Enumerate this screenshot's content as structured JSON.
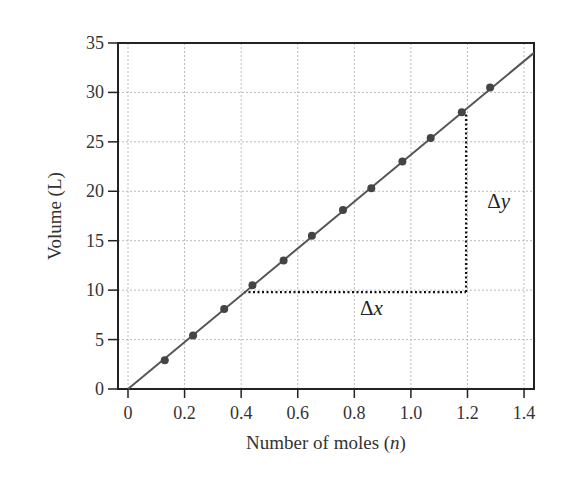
{
  "chart_data": {
    "type": "line",
    "title": "",
    "xlabel": "Number of moles (n)",
    "xlabel_parts": {
      "prefix": "Number of moles (",
      "var": "n",
      "suffix": ")"
    },
    "ylabel": "Volume (L)",
    "xlim": [
      0,
      1.45
    ],
    "ylim": [
      0,
      35
    ],
    "xticks": [
      "0",
      "0.2",
      "0.4",
      "0.6",
      "0.8",
      "1.0",
      "1.2",
      "1.4"
    ],
    "xtick_values": [
      0,
      0.2,
      0.4,
      0.6,
      0.8,
      1.0,
      1.2,
      1.4
    ],
    "yticks": [
      "0",
      "5",
      "10",
      "15",
      "20",
      "25",
      "30",
      "35"
    ],
    "ytick_values": [
      0,
      5,
      10,
      15,
      20,
      25,
      30,
      35
    ],
    "grid": true,
    "legend": null,
    "series": [
      {
        "name": "Volume vs moles",
        "x": [
          0.13,
          0.23,
          0.34,
          0.44,
          0.55,
          0.65,
          0.76,
          0.86,
          0.97,
          1.07,
          1.18,
          1.28
        ],
        "y": [
          2.9,
          5.4,
          8.1,
          10.5,
          13.0,
          15.5,
          18.1,
          20.3,
          23.0,
          25.4,
          28.0,
          30.5
        ],
        "markers": true
      }
    ],
    "fit_line": {
      "from": [
        0,
        0
      ],
      "to": [
        1.435,
        34.0
      ]
    },
    "annotations": [
      {
        "text": "Δx",
        "symbol": "Δ",
        "var": "x",
        "position": [
          0.82,
          7.5
        ]
      },
      {
        "text": "Δy",
        "symbol": "Δ",
        "var": "y",
        "position": [
          1.27,
          18.3
        ]
      }
    ],
    "slope_triangle": {
      "horizontal": {
        "x_from": 0.41,
        "x_to": 1.195,
        "y": 9.8
      },
      "vertical": {
        "x": 1.195,
        "y_from": 9.8,
        "y_to": 28.0
      }
    },
    "colors": {
      "line": "#555555",
      "marker": "#444444",
      "grid": "#bbbbbb",
      "frame": "#222222",
      "dotted": "#111111"
    }
  }
}
